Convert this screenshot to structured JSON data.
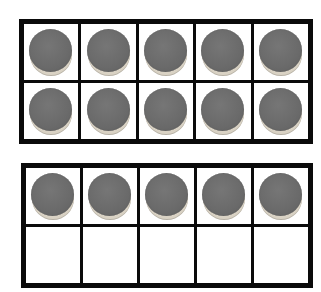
{
  "colors": {
    "frame_border": "#0a0a0a",
    "cell_background": "#ffffff",
    "counter_fill": "#6e6e6e",
    "counter_rim": "#d9d2c4"
  },
  "ten_frames": [
    {
      "id": "frame-1",
      "rows": 2,
      "columns": 5,
      "filled_count": 10,
      "cells": [
        true,
        true,
        true,
        true,
        true,
        true,
        true,
        true,
        true,
        true
      ]
    },
    {
      "id": "frame-2",
      "rows": 2,
      "columns": 5,
      "filled_count": 5,
      "cells": [
        true,
        true,
        true,
        true,
        true,
        false,
        false,
        false,
        false,
        false
      ]
    }
  ],
  "total_counters": 15
}
